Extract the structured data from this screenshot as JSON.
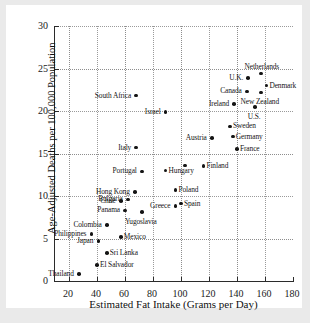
{
  "chart_data": {
    "type": "scatter",
    "title": "",
    "xlabel": "Estimated Fat Intake (Grams per Day)",
    "ylabel": "Age-Adjusted Deaths per 100,000 Population",
    "xlim": [
      10,
      180
    ],
    "ylim": [
      0,
      30
    ],
    "xticks": [
      20,
      40,
      60,
      80,
      100,
      120,
      140,
      160,
      180
    ],
    "yticks": [
      0,
      5,
      10,
      15,
      20,
      25,
      30
    ],
    "grid": true,
    "legend": null,
    "points": [
      {
        "label": "Thailand",
        "x": 27,
        "y": 0.8,
        "pos": "left"
      },
      {
        "label": "El Salvador",
        "x": 40,
        "y": 1.9,
        "pos": "right"
      },
      {
        "label": "Sri Lanka",
        "x": 47,
        "y": 3.3,
        "pos": "right"
      },
      {
        "label": "Japan",
        "x": 41,
        "y": 4.7,
        "pos": "left"
      },
      {
        "label": "Mexico",
        "x": 57,
        "y": 5.2,
        "pos": "right"
      },
      {
        "label": "Philippines",
        "x": 36,
        "y": 5.5,
        "pos": "left"
      },
      {
        "label": "Colombia",
        "x": 47,
        "y": 6.6,
        "pos": "left"
      },
      {
        "label": "Yugoslavia",
        "x": 72,
        "y": 8.1,
        "pos": "below"
      },
      {
        "label": "Panama",
        "x": 60,
        "y": 8.3,
        "pos": "left"
      },
      {
        "label": "Greece",
        "x": 96,
        "y": 8.8,
        "pos": "left"
      },
      {
        "label": "Spain",
        "x": 100,
        "y": 9.1,
        "pos": "right"
      },
      {
        "label": "Chile",
        "x": 57,
        "y": 9.4,
        "pos": "left"
      },
      {
        "label": "Bulgaria",
        "x": 62,
        "y": 9.6,
        "pos": "left"
      },
      {
        "label": "Hong Kong",
        "x": 67,
        "y": 10.5,
        "pos": "left"
      },
      {
        "label": "Poland",
        "x": 96,
        "y": 10.7,
        "pos": "right"
      },
      {
        "label": "Portugal",
        "x": 72,
        "y": 12.9,
        "pos": "left"
      },
      {
        "label": "Hungary",
        "x": 89,
        "y": 13.0,
        "pos": "right"
      },
      {
        "label": "Finland",
        "x": 116,
        "y": 13.5,
        "pos": "right"
      },
      {
        "label": "",
        "x": 103,
        "y": 13.6,
        "pos": "none"
      },
      {
        "label": "Italy",
        "x": 68,
        "y": 15.7,
        "pos": "left"
      },
      {
        "label": "France",
        "x": 140,
        "y": 15.5,
        "pos": "right"
      },
      {
        "label": "Austria",
        "x": 122,
        "y": 16.8,
        "pos": "left"
      },
      {
        "label": "Germany",
        "x": 137,
        "y": 17.0,
        "pos": "right"
      },
      {
        "label": "Sweden",
        "x": 135,
        "y": 18.2,
        "pos": "right"
      },
      {
        "label": "Israel",
        "x": 89,
        "y": 19.9,
        "pos": "left"
      },
      {
        "label": "U.S.",
        "x": 153,
        "y": 20.5,
        "pos": "below"
      },
      {
        "label": "Ireland",
        "x": 138,
        "y": 20.8,
        "pos": "left"
      },
      {
        "label": "South Africa",
        "x": 68,
        "y": 21.8,
        "pos": "left"
      },
      {
        "label": "New Zealand",
        "x": 157,
        "y": 22.2,
        "pos": "below"
      },
      {
        "label": "Canada",
        "x": 147,
        "y": 22.3,
        "pos": "left"
      },
      {
        "label": "Denmark",
        "x": 161,
        "y": 23.0,
        "pos": "right"
      },
      {
        "label": "U.K.",
        "x": 148,
        "y": 23.9,
        "pos": "left"
      },
      {
        "label": "Netherlands",
        "x": 157,
        "y": 24.4,
        "pos": "above"
      }
    ]
  }
}
